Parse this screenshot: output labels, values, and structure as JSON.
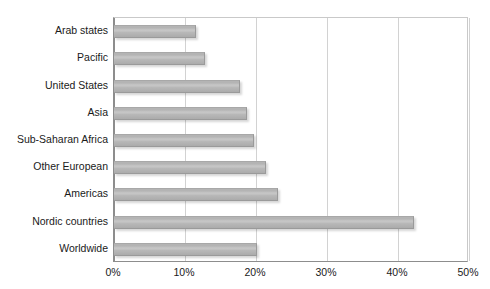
{
  "chart_data": {
    "type": "bar",
    "orientation": "horizontal",
    "title": "",
    "xlabel": "",
    "ylabel": "",
    "categories": [
      "Arab states",
      "Pacific",
      "United States",
      "Asia",
      "Sub-Saharan Africa",
      "Other European",
      "Americas",
      "Nordic countries",
      "Worldwide"
    ],
    "values": [
      11.5,
      12.8,
      17.7,
      18.7,
      19.7,
      21.4,
      23.1,
      42.2,
      20.1
    ],
    "value_unit": "%",
    "xlim": [
      0,
      50
    ],
    "xticks": [
      0,
      10,
      20,
      30,
      40,
      50
    ],
    "xtick_labels": [
      "0%",
      "10%",
      "20%",
      "30%",
      "40%",
      "50%"
    ],
    "grid": "vertical",
    "legend": "none",
    "bar_color": "#b4b4b4",
    "axis_color": "#8d8d8d",
    "gridline_color": "#d2d2d2",
    "background_color": "#ffffff"
  }
}
